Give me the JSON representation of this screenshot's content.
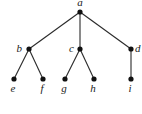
{
  "diagram": {
    "type": "rooted-tree",
    "root": "a",
    "nodes": [
      {
        "id": "a",
        "label": "a"
      },
      {
        "id": "b",
        "label": "b"
      },
      {
        "id": "c",
        "label": "c"
      },
      {
        "id": "d",
        "label": "d"
      },
      {
        "id": "e",
        "label": "e"
      },
      {
        "id": "f",
        "label": "f"
      },
      {
        "id": "g",
        "label": "g"
      },
      {
        "id": "h",
        "label": "h"
      },
      {
        "id": "i",
        "label": "i"
      }
    ],
    "edges": [
      {
        "from": "a",
        "to": "b"
      },
      {
        "from": "a",
        "to": "c"
      },
      {
        "from": "a",
        "to": "d"
      },
      {
        "from": "b",
        "to": "e"
      },
      {
        "from": "b",
        "to": "f"
      },
      {
        "from": "c",
        "to": "g"
      },
      {
        "from": "c",
        "to": "h"
      },
      {
        "from": "d",
        "to": "i"
      }
    ]
  }
}
